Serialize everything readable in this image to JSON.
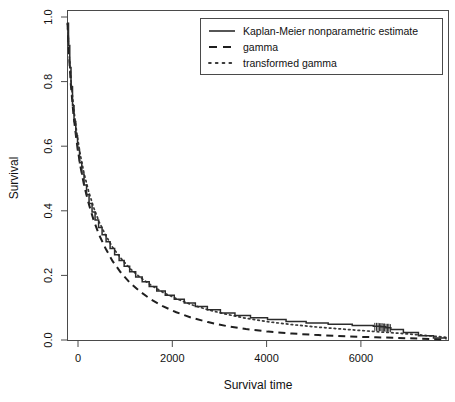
{
  "chart_data": {
    "type": "line",
    "title": "",
    "xlabel": "Survival time",
    "ylabel": "Survival",
    "xlim": [
      0,
      7600
    ],
    "ylim": [
      0.0,
      1.04
    ],
    "grid": false,
    "legend_position": "top-right",
    "xticks": [
      0,
      2000,
      4000,
      6000
    ],
    "xtick_labels": [
      "0",
      "2000",
      "4000",
      "6000"
    ],
    "yticks": [
      0.0,
      0.2,
      0.4,
      0.6,
      0.8,
      1.0
    ],
    "ytick_labels": [
      "0.0",
      "0.2",
      "0.4",
      "0.6",
      "0.8",
      "1.0"
    ],
    "series": [
      {
        "name": "Kaplan-Meier nonparametric estimate",
        "style": "solid",
        "color": "#2b2b2b",
        "x": [
          0,
          20,
          45,
          70,
          100,
          130,
          165,
          200,
          240,
          285,
          330,
          380,
          430,
          490,
          550,
          620,
          690,
          770,
          850,
          940,
          1030,
          1130,
          1240,
          1360,
          1490,
          1630,
          1780,
          1950,
          2130,
          2330,
          2550,
          2790,
          3050,
          3340,
          3650,
          3990,
          4360,
          4760,
          5200,
          5680,
          6100,
          6250,
          6350,
          6450,
          6700,
          7000,
          7300,
          7550
        ],
        "y": [
          1.0,
          0.93,
          0.86,
          0.8,
          0.74,
          0.69,
          0.645,
          0.6,
          0.56,
          0.525,
          0.49,
          0.46,
          0.432,
          0.405,
          0.38,
          0.356,
          0.333,
          0.311,
          0.29,
          0.27,
          0.252,
          0.234,
          0.217,
          0.2,
          0.185,
          0.17,
          0.156,
          0.143,
          0.13,
          0.118,
          0.107,
          0.097,
          0.087,
          0.079,
          0.072,
          0.066,
          0.06,
          0.055,
          0.051,
          0.047,
          0.045,
          0.043,
          0.04,
          0.035,
          0.025,
          0.015,
          0.008,
          0.003
        ]
      },
      {
        "name": "gamma",
        "style": "dashed",
        "color": "#1f1f1f",
        "x": [
          0,
          30,
          70,
          120,
          180,
          250,
          330,
          420,
          520,
          630,
          760,
          900,
          1060,
          1240,
          1440,
          1660,
          1900,
          2170,
          2470,
          2800,
          3160,
          3560,
          4000,
          4480,
          5000,
          5560,
          6150,
          6600,
          7000,
          7350,
          7550
        ],
        "y": [
          1.0,
          0.9,
          0.8,
          0.71,
          0.63,
          0.555,
          0.49,
          0.433,
          0.38,
          0.333,
          0.29,
          0.25,
          0.215,
          0.183,
          0.155,
          0.13,
          0.108,
          0.089,
          0.072,
          0.058,
          0.046,
          0.036,
          0.028,
          0.022,
          0.017,
          0.013,
          0.01,
          0.008,
          0.006,
          0.004,
          0.003
        ]
      },
      {
        "name": "transformed gamma",
        "style": "dotted",
        "color": "#3a3a3a",
        "x": [
          0,
          30,
          70,
          120,
          180,
          250,
          330,
          420,
          520,
          630,
          760,
          900,
          1060,
          1240,
          1440,
          1660,
          1900,
          2170,
          2470,
          2800,
          3160,
          3560,
          4000,
          4480,
          5000,
          5560,
          6150,
          6600,
          7000,
          7350,
          7550
        ],
        "y": [
          1.0,
          0.91,
          0.82,
          0.735,
          0.66,
          0.59,
          0.527,
          0.471,
          0.42,
          0.374,
          0.332,
          0.294,
          0.26,
          0.228,
          0.2,
          0.175,
          0.152,
          0.132,
          0.113,
          0.097,
          0.083,
          0.07,
          0.059,
          0.05,
          0.042,
          0.035,
          0.028,
          0.023,
          0.018,
          0.013,
          0.01
        ]
      }
    ],
    "censor_marks": {
      "label": "censoring-ticks",
      "x": [
        6130,
        6165,
        6195,
        6225,
        6250,
        6275,
        6300,
        6325,
        6355,
        6385,
        6410,
        6440
      ],
      "y": [
        0.043,
        0.043,
        0.043,
        0.042,
        0.042,
        0.042,
        0.041,
        0.041,
        0.04,
        0.04,
        0.04,
        0.039
      ]
    }
  },
  "legend": {
    "entries": [
      {
        "label": "Kaplan-Meier nonparametric estimate"
      },
      {
        "label": "gamma"
      },
      {
        "label": "transformed gamma"
      }
    ]
  },
  "axes": {
    "x_title": "Survival time",
    "y_title": "Survival"
  }
}
